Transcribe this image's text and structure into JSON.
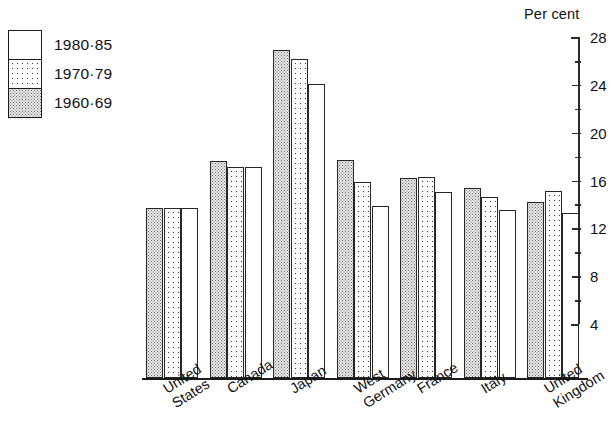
{
  "axis_title": "Per cent",
  "legend": {
    "items": [
      {
        "label": "1980·85",
        "pattern": "plain"
      },
      {
        "label": "1970·79",
        "pattern": "dots"
      },
      {
        "label": "1960·69",
        "pattern": "hatch"
      }
    ]
  },
  "chart_data": {
    "type": "bar",
    "title": "",
    "subtitle": "",
    "xlabel": "",
    "ylabel": "Per cent",
    "ylim": [
      4,
      28
    ],
    "yticks": [
      4,
      8,
      12,
      16,
      20,
      24,
      28
    ],
    "ytick_labels": [
      "4",
      "8",
      "12",
      "16",
      "20",
      "24",
      "28"
    ],
    "minor_tick_step": 2,
    "grid": false,
    "legend_position": "top-left",
    "orientation": "vertical",
    "categories": [
      "United States",
      "Canada",
      "Japan",
      "West Germany",
      "France",
      "Italy",
      "United Kingdom"
    ],
    "category_lines": [
      [
        "United",
        "States"
      ],
      [
        "Canada"
      ],
      [
        "Japan"
      ],
      [
        "West",
        "Germany"
      ],
      [
        "France"
      ],
      [
        "Italy"
      ],
      [
        "United",
        "Kingdom"
      ]
    ],
    "series": [
      {
        "name": "1960·69",
        "pattern": "hatch",
        "values": [
          13.7,
          17.6,
          26.9,
          17.7,
          16.2,
          15.4,
          14.2
        ]
      },
      {
        "name": "1970·79",
        "pattern": "dots",
        "values": [
          13.7,
          17.1,
          26.2,
          15.9,
          16.3,
          14.6,
          15.1
        ]
      },
      {
        "name": "1980·85",
        "pattern": "plain",
        "values": [
          13.7,
          17.1,
          24.1,
          13.9,
          15.0,
          13.5,
          13.3
        ]
      }
    ]
  }
}
